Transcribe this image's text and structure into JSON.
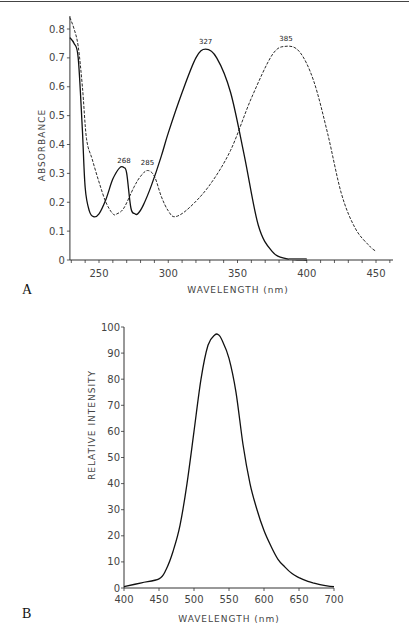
{
  "chart_data": [
    {
      "type": "line",
      "panel_label": "A",
      "title": "",
      "xlabel": "WAVELENGTH (nm)",
      "ylabel": "ABSORBANCE",
      "xlim": [
        229,
        460
      ],
      "ylim": [
        0,
        0.85
      ],
      "xticks": [
        250,
        300,
        350,
        400,
        450
      ],
      "yticks": [
        0,
        0.1,
        0.2,
        0.3,
        0.4,
        0.5,
        0.6,
        0.7,
        0.8
      ],
      "ytick_labels": [
        "0",
        "0.1",
        "0.2",
        "0.3",
        "0.4",
        "0.5",
        "0.6",
        "0.7",
        "0.8"
      ],
      "grid": false,
      "annotations": [
        {
          "text": "268",
          "x": 268,
          "y": 0.32
        },
        {
          "text": "285",
          "x": 285,
          "y": 0.31
        },
        {
          "text": "327",
          "x": 327,
          "y": 0.73
        },
        {
          "text": "385",
          "x": 385,
          "y": 0.74
        }
      ],
      "series": [
        {
          "name": "solid",
          "style": "solid",
          "x": [
            229,
            232,
            235,
            238,
            240,
            243,
            246,
            250,
            255,
            260,
            265,
            268,
            270,
            273,
            276,
            278,
            282,
            288,
            295,
            300,
            310,
            320,
            327,
            335,
            345,
            355,
            365,
            375,
            385,
            400
          ],
          "y": [
            0.77,
            0.75,
            0.7,
            0.45,
            0.25,
            0.17,
            0.15,
            0.16,
            0.21,
            0.28,
            0.32,
            0.32,
            0.3,
            0.18,
            0.16,
            0.16,
            0.19,
            0.26,
            0.36,
            0.44,
            0.58,
            0.7,
            0.73,
            0.7,
            0.58,
            0.36,
            0.12,
            0.03,
            0.005,
            0.0
          ]
        },
        {
          "name": "dashed",
          "style": "dashed",
          "x": [
            229,
            232,
            235,
            238,
            241,
            245,
            250,
            255,
            260,
            263,
            268,
            275,
            280,
            285,
            290,
            295,
            300,
            305,
            315,
            330,
            345,
            360,
            375,
            385,
            395,
            405,
            415,
            425,
            435,
            445,
            450
          ],
          "y": [
            0.84,
            0.8,
            0.74,
            0.6,
            0.42,
            0.35,
            0.27,
            0.2,
            0.16,
            0.16,
            0.18,
            0.25,
            0.29,
            0.31,
            0.29,
            0.22,
            0.17,
            0.15,
            0.18,
            0.26,
            0.38,
            0.56,
            0.71,
            0.74,
            0.72,
            0.62,
            0.44,
            0.23,
            0.11,
            0.05,
            0.03
          ]
        }
      ]
    },
    {
      "type": "line",
      "panel_label": "B",
      "title": "",
      "xlabel": "WAVELENGTH (nm)",
      "ylabel": "RELATIVE INTENSITY",
      "xlim": [
        400,
        700
      ],
      "ylim": [
        0,
        100
      ],
      "xticks": [
        400,
        450,
        500,
        550,
        600,
        650,
        700
      ],
      "yticks": [
        0,
        10,
        20,
        30,
        40,
        50,
        60,
        70,
        80,
        90,
        100
      ],
      "ytick_labels": [
        "0",
        "10",
        "20",
        "30",
        "40",
        "50",
        "60",
        "70",
        "80",
        "90",
        "100"
      ],
      "grid": false,
      "series": [
        {
          "name": "emission",
          "style": "solid",
          "x": [
            400,
            425,
            450,
            460,
            470,
            480,
            490,
            500,
            510,
            520,
            530,
            535,
            540,
            550,
            560,
            570,
            580,
            590,
            600,
            610,
            620,
            630,
            640,
            650,
            660,
            670,
            680,
            690,
            700
          ],
          "y": [
            0.5,
            2,
            3.5,
            7,
            14,
            24,
            40,
            60,
            80,
            93,
            97,
            97,
            95,
            88,
            75,
            55,
            40,
            30,
            22,
            16,
            11,
            8,
            5.5,
            4,
            2.8,
            2,
            1.3,
            0.8,
            0.5
          ]
        }
      ]
    }
  ]
}
